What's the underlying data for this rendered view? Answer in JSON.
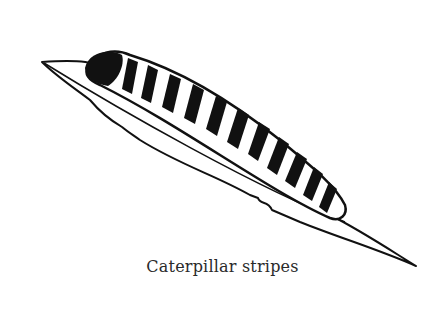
{
  "illustration": {
    "subject": "caterpillar on leaf",
    "caption": "Caterpillar stripes",
    "colors": {
      "ink": "#111111",
      "paper": "#ffffff"
    }
  }
}
